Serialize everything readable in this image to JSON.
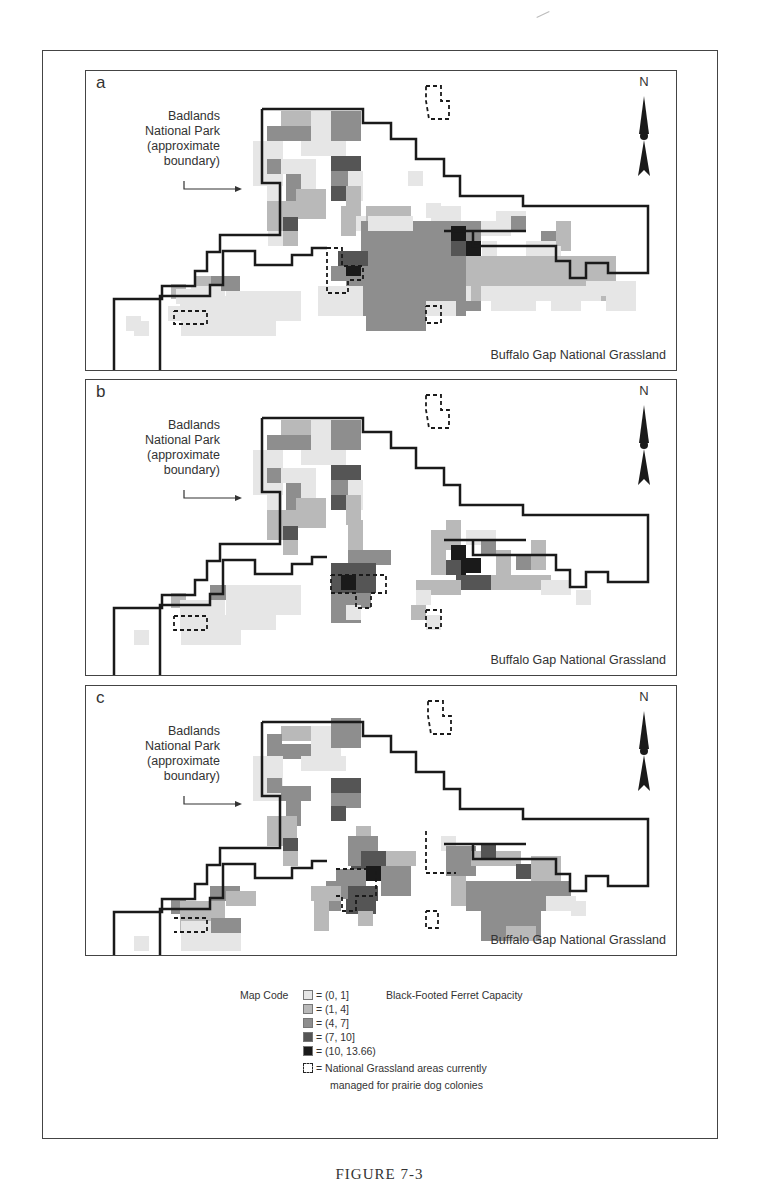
{
  "figure": {
    "caption": "FIGURE 7-3",
    "colors": {
      "level0": "#ffffff",
      "level1": "#e6e6e6",
      "level2": "#b9b9b9",
      "level3": "#8e8e8e",
      "level4": "#555555",
      "level5": "#1a1a1a",
      "boundary": "#1a1a1a",
      "frame": "#444444"
    }
  },
  "panels": [
    {
      "letter": "a",
      "park_label": [
        "Badlands",
        "National Park",
        "(approximate",
        "boundary)"
      ],
      "grassland_label": "Buffalo Gap National Grassland",
      "north_label": "N"
    },
    {
      "letter": "b",
      "park_label": [
        "Badlands",
        "National Park",
        "(approximate",
        "boundary)"
      ],
      "grassland_label": "Buffalo Gap National Grassland",
      "north_label": "N"
    },
    {
      "letter": "c",
      "park_label": [
        "Badlands",
        "National Park",
        "(approximate",
        "boundary)"
      ],
      "grassland_label": "Buffalo Gap National Grassland",
      "north_label": "N"
    }
  ],
  "legend": {
    "title": "Map Code",
    "measure": "Black-Footed Ferret Capacity",
    "items": [
      {
        "range": "= (0, 1]",
        "level": 1
      },
      {
        "range": "= (1, 4]",
        "level": 2
      },
      {
        "range": "= (4, 7]",
        "level": 3
      },
      {
        "range": "= (7, 10]",
        "level": 4
      },
      {
        "range": "= (10, 13.66)",
        "level": 5
      }
    ],
    "dashed_item": {
      "line1": "= National Grassland areas currently",
      "line2": "managed for prairie dog colonies"
    }
  },
  "chart_data": {
    "type": "heatmap",
    "panels": [
      "a",
      "b",
      "c"
    ],
    "legend_bins": [
      "(0, 1]",
      "(1, 4]",
      "(4, 7]",
      "(7, 10]",
      "(10, 13.66)"
    ],
    "annotations": [
      "Badlands National Park (approximate boundary)",
      "Buffalo Gap National Grassland",
      "N"
    ],
    "dashed_outline_meaning": "National Grassland areas currently managed for prairie dog colonies"
  }
}
